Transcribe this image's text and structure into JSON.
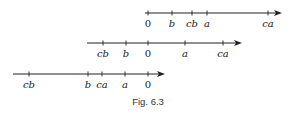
{
  "figure": {
    "caption": "Fig. 6.3",
    "lines": [
      {
        "id": "line-1",
        "y": 13,
        "x_start": 145,
        "x_end": 282,
        "points": [
          {
            "label": "0",
            "x": 148
          },
          {
            "label": "b",
            "x": 172
          },
          {
            "label": "cb",
            "x": 192
          },
          {
            "label": "a",
            "x": 207
          },
          {
            "label": "ca",
            "x": 268
          }
        ]
      },
      {
        "id": "line-2",
        "y": 43,
        "x_start": 87,
        "x_end": 242,
        "points": [
          {
            "label": "cb",
            "x": 103
          },
          {
            "label": "b",
            "x": 126
          },
          {
            "label": "0",
            "x": 148
          },
          {
            "label": "a",
            "x": 185
          },
          {
            "label": "ca",
            "x": 223
          }
        ]
      },
      {
        "id": "line-3",
        "y": 74,
        "x_start": 13,
        "x_end": 165,
        "points": [
          {
            "label": "cb",
            "x": 29
          },
          {
            "label": "b",
            "x": 88
          },
          {
            "label": "ca",
            "x": 102
          },
          {
            "label": "a",
            "x": 125
          },
          {
            "label": "0",
            "x": 148
          }
        ]
      }
    ],
    "colors": {
      "line": "#222222",
      "text": "#222222"
    }
  }
}
